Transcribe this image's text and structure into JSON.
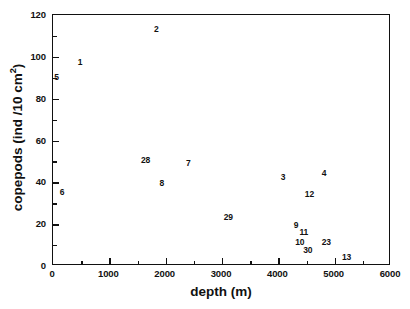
{
  "chart_data": {
    "type": "scatter",
    "title": "",
    "xlabel": "depth (m)",
    "ylabel": "copepods (ind /10 cm²)",
    "ylabel_parts": {
      "pre": "copepods (ind /10 cm",
      "sup": "2",
      "post": ")"
    },
    "xlim": [
      0,
      6000
    ],
    "ylim": [
      0,
      120
    ],
    "xticks": [
      0,
      1000,
      2000,
      3000,
      4000,
      5000,
      6000
    ],
    "xticklabels": [
      "0",
      "1000",
      "2000",
      "3000",
      "4000",
      "5000",
      "6000"
    ],
    "xminorticks": [
      500,
      1500,
      2500,
      3500,
      4500,
      5500
    ],
    "yticks": [
      0,
      20,
      40,
      60,
      80,
      100,
      120
    ],
    "yticklabels": [
      "0",
      "20",
      "40",
      "60",
      "80",
      "100",
      "120"
    ],
    "yminorticks": [
      10,
      30,
      50,
      70,
      90,
      110
    ],
    "grid": false,
    "legend": false,
    "marker_style": "text-label",
    "points": [
      {
        "label": "5",
        "x": 80,
        "y": 90
      },
      {
        "label": "1",
        "x": 500,
        "y": 97
      },
      {
        "label": "6",
        "x": 180,
        "y": 35
      },
      {
        "label": "2",
        "x": 1850,
        "y": 113
      },
      {
        "label": "28",
        "x": 1660,
        "y": 50
      },
      {
        "label": "8",
        "x": 1950,
        "y": 39
      },
      {
        "label": "7",
        "x": 2420,
        "y": 49
      },
      {
        "label": "29",
        "x": 3130,
        "y": 23
      },
      {
        "label": "3",
        "x": 4100,
        "y": 42
      },
      {
        "label": "9",
        "x": 4330,
        "y": 19
      },
      {
        "label": "10",
        "x": 4400,
        "y": 11
      },
      {
        "label": "11",
        "x": 4470,
        "y": 16
      },
      {
        "label": "30",
        "x": 4540,
        "y": 7
      },
      {
        "label": "12",
        "x": 4570,
        "y": 34
      },
      {
        "label": "4",
        "x": 4830,
        "y": 44
      },
      {
        "label": "23",
        "x": 4870,
        "y": 11
      },
      {
        "label": "13",
        "x": 5230,
        "y": 4
      }
    ],
    "colors": {
      "axis": "#111111",
      "text": "#111111",
      "background": "#ffffff"
    }
  }
}
